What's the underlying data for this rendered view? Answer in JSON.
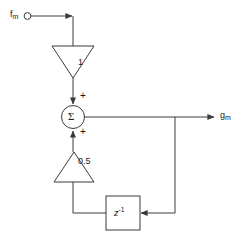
{
  "diagram": {
    "type": "signal-flow-block-diagram",
    "title": "",
    "background_color": "#ffffff",
    "line_color": "#3a3a3a",
    "text_color": "#1a1a1a",
    "input": {
      "label": "f",
      "subscript": "m",
      "terminal_icon": "open-circle-terminal"
    },
    "output": {
      "label": "g",
      "subscript": "m"
    },
    "gain_forward": {
      "value": "1",
      "shape": "triangle-down"
    },
    "gain_feedback": {
      "value": "0.5",
      "shape": "triangle-up"
    },
    "summing_junction": {
      "glyph": "Σ",
      "top_input_sign": "+",
      "bottom_input_sign": "+"
    },
    "delay_block": {
      "label": "z",
      "exponent": "-1",
      "shape": "rectangle"
    }
  }
}
